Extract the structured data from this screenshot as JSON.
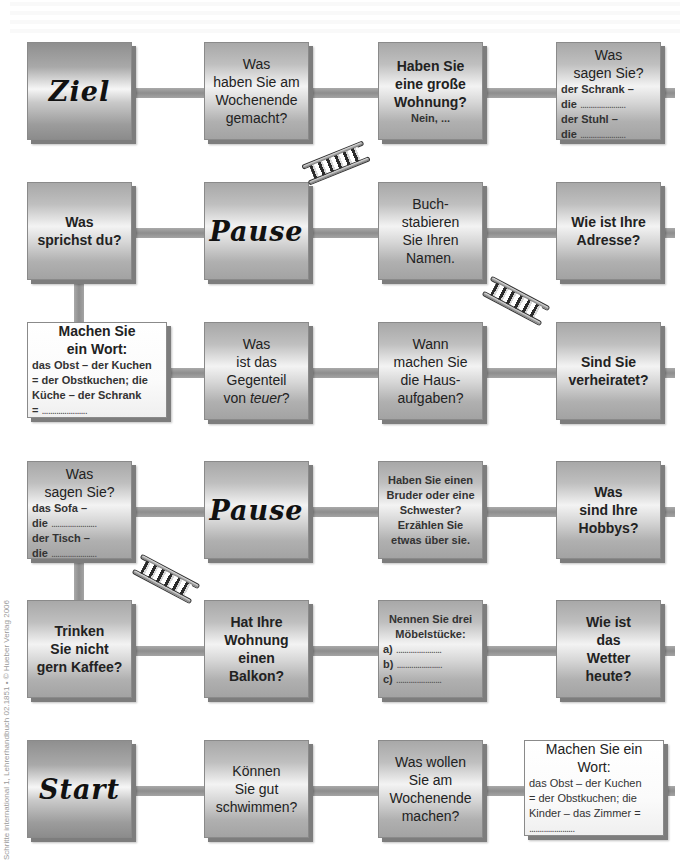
{
  "board": {
    "rows": [
      {
        "fields": [
          {
            "type": "goal",
            "label": "Ziel"
          },
          {
            "type": "question",
            "text": [
              "Was",
              "haben Sie am",
              "Wochenende",
              "gemacht?"
            ]
          },
          {
            "type": "question",
            "text": [
              "Haben Sie",
              "eine große",
              "Wohnung?"
            ],
            "subtext": "Nein, ..."
          },
          {
            "type": "fill-in",
            "title": [
              "Was",
              "sagen Sie?"
            ],
            "lines": [
              "der Schrank –",
              "die ",
              "der Stuhl –",
              "die "
            ]
          }
        ]
      },
      {
        "fields": [
          {
            "type": "question",
            "text": [
              "Was",
              "sprichst du?"
            ]
          },
          {
            "type": "pause",
            "label": "Pause"
          },
          {
            "type": "question",
            "text": [
              "Buch-",
              "stabieren",
              "Sie Ihren",
              "Namen."
            ]
          },
          {
            "type": "question",
            "text": [
              "Wie ist Ihre",
              "Adresse?"
            ]
          }
        ]
      },
      {
        "fields": [
          {
            "type": "fill-in",
            "title": [
              "Machen Sie",
              "ein Wort:"
            ],
            "lines": [
              "das Obst – der Kuchen",
              "= der Obstkuchen; die",
              "Küche – der Schrank",
              "= "
            ]
          },
          {
            "type": "question",
            "text": [
              "Was",
              "ist das",
              "Gegenteil"
            ],
            "last_plain": "von ",
            "last_italic": "teuer",
            "last_end": "?"
          },
          {
            "type": "question",
            "text": [
              "Wann",
              "machen Sie",
              "die Haus-",
              "aufgaben?"
            ]
          },
          {
            "type": "question",
            "text": [
              "Sind Sie",
              "verheiratet?"
            ]
          }
        ]
      },
      {
        "fields": [
          {
            "type": "fill-in",
            "title": [
              "Was",
              "sagen Sie?"
            ],
            "lines": [
              "das Sofa –",
              "die ",
              "der Tisch –",
              "die "
            ]
          },
          {
            "type": "pause",
            "label": "Pause"
          },
          {
            "type": "question",
            "text": [
              "Haben Sie einen",
              "Bruder oder eine",
              "Schwester?",
              "Erzählen Sie",
              "etwas über sie."
            ]
          },
          {
            "type": "question",
            "text": [
              "Was",
              "sind Ihre",
              "Hobbys?"
            ]
          }
        ]
      },
      {
        "fields": [
          {
            "type": "question",
            "text": [
              "Trinken",
              "Sie nicht",
              "gern Kaffee?"
            ]
          },
          {
            "type": "question",
            "text": [
              "Hat Ihre",
              "Wohnung",
              "einen Balkon?"
            ]
          },
          {
            "type": "fill-in",
            "title": [
              "Nennen Sie drei",
              "Möbelstücke:"
            ],
            "lines": [
              "a) ",
              "b) ",
              "c) "
            ]
          },
          {
            "type": "question",
            "text": [
              "Wie ist",
              "das",
              "Wetter",
              "heute?"
            ]
          }
        ]
      },
      {
        "fields": [
          {
            "type": "start",
            "label": "Start"
          },
          {
            "type": "question",
            "text": [
              "Können",
              "Sie gut",
              "schwimmen?"
            ]
          },
          {
            "type": "question",
            "text": [
              "Was wollen",
              "Sie am",
              "Wochenende",
              "machen?"
            ]
          },
          {
            "type": "fill-in",
            "title": [
              "Machen Sie ein",
              "Wort:"
            ],
            "lines": [
              "das Obst – der Kuchen",
              "= der Obstkuchen; die",
              "Kinder – das Zimmer =",
              ""
            ]
          }
        ]
      }
    ],
    "dots": "......................",
    "ladders": [
      {
        "from": "row2-field2",
        "to": "row1-field3"
      },
      {
        "from": "row3-field4",
        "to": "row2-field3"
      },
      {
        "from": "row5-field2",
        "to": "row4-field1"
      }
    ]
  },
  "copyright": "Schritte international 1, Lehrerhandbuch 02.1851  •  © Hueber Verlag 2006"
}
